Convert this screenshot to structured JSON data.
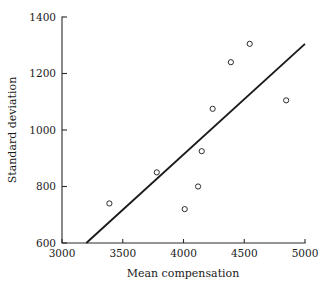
{
  "chart_data": {
    "type": "scatter",
    "title": "",
    "xlabel": "Mean compensation",
    "ylabel": "Standard deviation",
    "xlim": [
      3000,
      5000
    ],
    "ylim": [
      600,
      1400
    ],
    "xticks": [
      3000,
      3500,
      4000,
      4500,
      5000
    ],
    "yticks": [
      600,
      800,
      1000,
      1200,
      1400
    ],
    "xtick_labels": [
      "3000",
      "3500",
      "4000",
      "4500",
      "5000"
    ],
    "ytick_labels": [
      "600",
      "800",
      "1000",
      "1200",
      "1400"
    ],
    "grid": false,
    "legend": false,
    "legend_position": "none",
    "marker": "open-circle",
    "points": [
      {
        "x": 3390,
        "y": 740
      },
      {
        "x": 3780,
        "y": 850
      },
      {
        "x": 4010,
        "y": 720
      },
      {
        "x": 4120,
        "y": 800
      },
      {
        "x": 4150,
        "y": 925
      },
      {
        "x": 4240,
        "y": 1075
      },
      {
        "x": 4390,
        "y": 1240
      },
      {
        "x": 4545,
        "y": 1305
      },
      {
        "x": 4845,
        "y": 1105
      }
    ],
    "series": [
      {
        "name": "observations",
        "x": [
          3390,
          3780,
          4010,
          4120,
          4150,
          4240,
          4390,
          4545,
          4845
        ],
        "values": [
          740,
          850,
          720,
          800,
          925,
          1075,
          1240,
          1305,
          1105
        ]
      }
    ],
    "annotations": [],
    "fit_line": {
      "name": "regression-line",
      "x_start": 3200,
      "y_start": 600,
      "x_end": 5000,
      "y_end": 1305
    },
    "colors": {
      "marker_stroke": "#2b2b2b",
      "line": "#1a1a1a",
      "axis": "#2b2b2b",
      "background": "#ffffff"
    }
  },
  "geometry": {
    "plot_left": 62,
    "plot_right": 305,
    "plot_top": 17,
    "plot_bottom": 243
  }
}
